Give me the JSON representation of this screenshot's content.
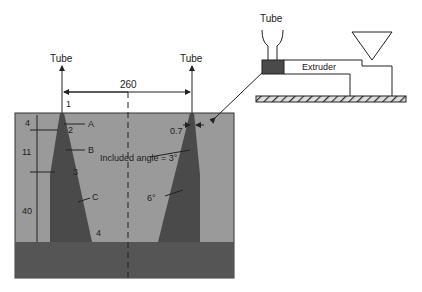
{
  "die": {
    "tube_left_label": "Tube",
    "tube_right_label": "Tube",
    "width_dim": "260",
    "zone_labels": [
      "1",
      "2",
      "3",
      "4"
    ],
    "letter_labels": [
      "A",
      "B",
      "C"
    ],
    "heights": [
      "4",
      "11",
      "40"
    ],
    "gap_dim": "0.7",
    "included_angle": "Included angle = 3°",
    "taper_angle": "6°"
  },
  "extruder": {
    "tube_label": "Tube",
    "extruder_label": "Extruder"
  },
  "colors": {
    "die_fill": "#9a9a9a",
    "mandrel_fill": "#4a4a4a",
    "base_fill": "#555555"
  }
}
